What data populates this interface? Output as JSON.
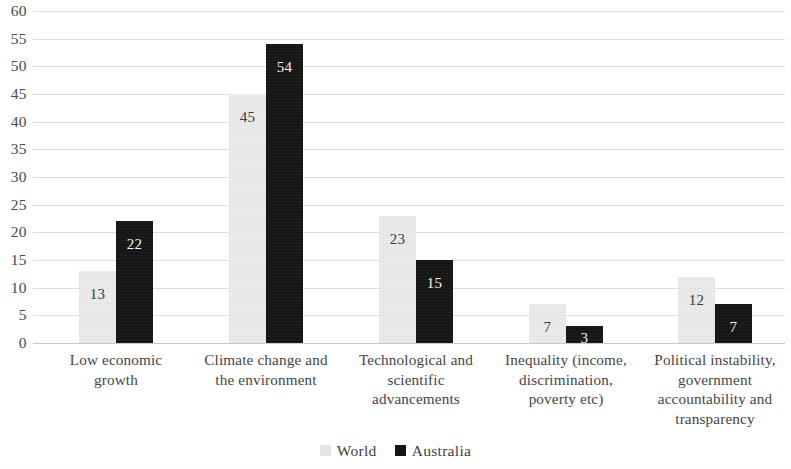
{
  "chart_data": {
    "type": "bar",
    "title": "",
    "subtitle": "",
    "xlabel": "",
    "ylabel": "",
    "ylim": [
      0,
      60
    ],
    "ytick_step": 5,
    "yticks": [
      "60",
      "55",
      "50",
      "45",
      "40",
      "35",
      "30",
      "25",
      "20",
      "15",
      "10",
      "5",
      "0"
    ],
    "grid": true,
    "grid_axis": "y",
    "legend_position": "bottom-center",
    "categories": [
      "Low economic growth",
      "Climate change and the environment",
      "Technological and scientific advancements",
      "Inequality (income, discrimination, poverty etc)",
      "Political instability, government accountability and transparency"
    ],
    "category_lines": [
      [
        "Low economic",
        "growth"
      ],
      [
        "Climate change and",
        "the environment"
      ],
      [
        "Technological and",
        "scientific",
        "advancements"
      ],
      [
        "Inequality (income,",
        "discrimination,",
        "poverty etc)"
      ],
      [
        "Political instability,",
        "government",
        "accountability and",
        "transparency"
      ]
    ],
    "series": [
      {
        "name": "World",
        "color": "#ebebeb",
        "values": [
          13,
          45,
          23,
          7,
          12
        ],
        "labels": [
          "13",
          "45",
          "23",
          "7",
          "12"
        ]
      },
      {
        "name": "Australia",
        "color": "#161616",
        "values": [
          22,
          54,
          15,
          3,
          7
        ],
        "labels": [
          "22",
          "54",
          "15",
          "3",
          "7"
        ]
      }
    ]
  },
  "legend": {
    "items": [
      {
        "label": "World",
        "swatch": "world"
      },
      {
        "label": "Australia",
        "swatch": "australia"
      }
    ]
  },
  "colors": {
    "world_bar": "#ebebeb",
    "australia_bar": "#161616",
    "gridline": "#dedede",
    "axis_text": "#4a4a4a",
    "background": "#ffffff"
  }
}
